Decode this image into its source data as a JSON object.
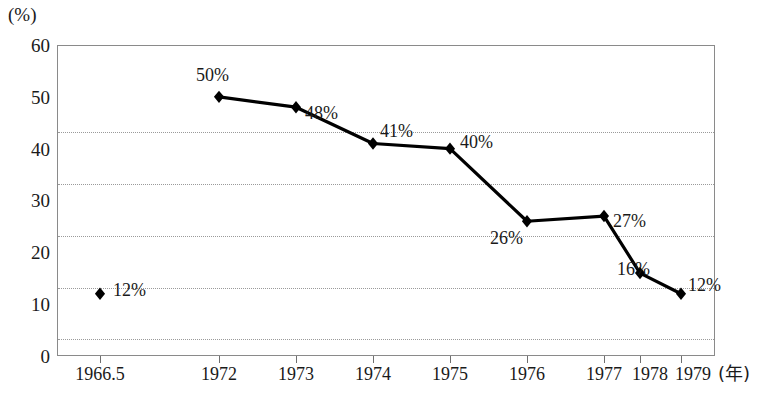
{
  "chart_data": {
    "type": "line",
    "title": "",
    "subtitle": "",
    "xlabel": "(年)",
    "ylabel": "(%)",
    "ylim": [
      0,
      60
    ],
    "y_ticks": [
      0,
      10,
      20,
      30,
      40,
      50,
      60
    ],
    "y_tick_labels": [
      "0",
      "10",
      "20",
      "30",
      "40",
      "50",
      "60"
    ],
    "grid": true,
    "grid_axis": "y",
    "legend": "none",
    "categories": [
      "1966.5",
      "1972",
      "1973",
      "1974",
      "1975",
      "1976",
      "1977",
      "1978",
      "1979"
    ],
    "values": [
      12,
      50,
      48,
      41,
      40,
      26,
      27,
      16,
      12
    ],
    "data_labels": [
      "12%",
      "50%",
      "48%",
      "41%",
      "40%",
      "26%",
      "27%",
      "16%",
      "12%"
    ],
    "series": [
      {
        "name": "",
        "values": [
          12,
          50,
          48,
          41,
          40,
          26,
          27,
          16,
          12
        ],
        "marker": "diamond",
        "marker_color": "#000000",
        "line_color": "#000000",
        "connected_from_index": 1
      }
    ]
  },
  "axes": {
    "unit_label": "(%)",
    "x_unit_label": "(年)",
    "y_ticks": [
      {
        "label": "60",
        "value": 60
      },
      {
        "label": "50",
        "value": 50
      },
      {
        "label": "40",
        "value": 40
      },
      {
        "label": "30",
        "value": 30
      },
      {
        "label": "20",
        "value": 20
      },
      {
        "label": "10",
        "value": 10
      },
      {
        "label": "0",
        "value": 0
      }
    ],
    "x_ticks": [
      {
        "label": "1966.5"
      },
      {
        "label": "1972"
      },
      {
        "label": "1973"
      },
      {
        "label": "1974"
      },
      {
        "label": "1975"
      },
      {
        "label": "1976"
      },
      {
        "label": "1977"
      },
      {
        "label": "1978"
      },
      {
        "label": "1979"
      }
    ]
  },
  "points": [
    {
      "category": "1966.5",
      "value": 12,
      "label": "12%"
    },
    {
      "category": "1972",
      "value": 50,
      "label": "50%"
    },
    {
      "category": "1973",
      "value": 48,
      "label": "48%"
    },
    {
      "category": "1974",
      "value": 41,
      "label": "41%"
    },
    {
      "category": "1975",
      "value": 40,
      "label": "40%"
    },
    {
      "category": "1976",
      "value": 26,
      "label": "26%"
    },
    {
      "category": "1977",
      "value": 27,
      "label": "27%"
    },
    {
      "category": "1978",
      "value": 16,
      "label": "16%"
    },
    {
      "category": "1979",
      "value": 12,
      "label": "12%"
    }
  ],
  "colors": {
    "line": "#000000",
    "marker": "#000000",
    "grid": "#9a9a9a",
    "frame": "#8a8a8a",
    "text": "#1a1a1a",
    "background": "#ffffff"
  }
}
